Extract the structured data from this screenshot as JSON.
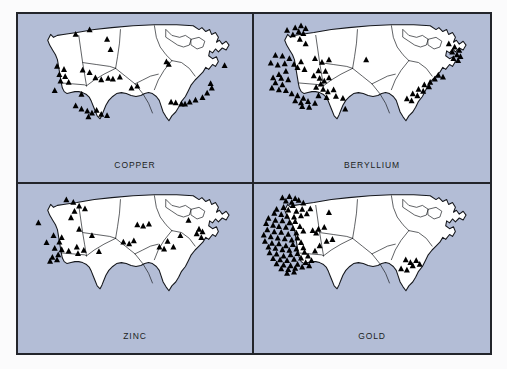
{
  "figure": {
    "background_color": "#fbfbfc",
    "panel_background_color": "#b3bdd6",
    "border_color": "#23252b",
    "land_fill_color": "#ffffff",
    "marker_color": "#000000",
    "marker_shape": "triangle",
    "map_subject": "contiguous-united-states",
    "layout": "2x2-grid"
  },
  "chart_data": {
    "type": "scatter",
    "subtitle": "",
    "xlabel": "",
    "ylabel": "",
    "grid": false,
    "legend_position": "none",
    "marker": "triangle",
    "panels": [
      {
        "id": "copper",
        "label": "COPPER",
        "position": "top-left",
        "marker_count": 42,
        "points": [
          [
            24.5,
            14.0
          ],
          [
            30.5,
            10.5
          ],
          [
            38.0,
            18.0
          ],
          [
            39.5,
            26.0
          ],
          [
            16.5,
            39.0
          ],
          [
            19.5,
            41.5
          ],
          [
            17.5,
            45.5
          ],
          [
            20.0,
            47.0
          ],
          [
            18.0,
            50.5
          ],
          [
            21.5,
            51.5
          ],
          [
            27.5,
            42.0
          ],
          [
            30.5,
            44.0
          ],
          [
            33.0,
            48.0
          ],
          [
            35.5,
            49.5
          ],
          [
            38.5,
            48.5
          ],
          [
            40.5,
            49.0
          ],
          [
            43.5,
            47.5
          ],
          [
            15.5,
            58.0
          ],
          [
            27.0,
            61.0
          ],
          [
            24.5,
            70.0
          ],
          [
            27.0,
            72.5
          ],
          [
            29.5,
            74.0
          ],
          [
            31.5,
            75.5
          ],
          [
            33.5,
            73.5
          ],
          [
            35.5,
            76.5
          ],
          [
            38.0,
            77.5
          ],
          [
            30.0,
            78.5
          ],
          [
            48.5,
            56.0
          ],
          [
            51.0,
            54.5
          ],
          [
            63.5,
            35.5
          ],
          [
            64.5,
            37.5
          ],
          [
            88.5,
            38.5
          ],
          [
            82.5,
            52.5
          ],
          [
            83.0,
            56.0
          ],
          [
            81.0,
            60.0
          ],
          [
            79.0,
            63.5
          ],
          [
            76.0,
            65.5
          ],
          [
            73.5,
            67.0
          ],
          [
            71.5,
            68.5
          ],
          [
            70.0,
            68.5
          ],
          [
            67.5,
            67.5
          ],
          [
            65.5,
            67.0
          ]
        ]
      },
      {
        "id": "beryllium",
        "label": "BERYLLIUM",
        "position": "top-right",
        "marker_count": 78,
        "points": [
          [
            13.5,
            11.0
          ],
          [
            17.0,
            9.0
          ],
          [
            19.5,
            7.5
          ],
          [
            21.5,
            9.5
          ],
          [
            18.5,
            12.0
          ],
          [
            20.5,
            13.5
          ],
          [
            16.0,
            14.5
          ],
          [
            19.0,
            18.0
          ],
          [
            21.5,
            21.5
          ],
          [
            8.5,
            30.5
          ],
          [
            11.5,
            31.0
          ],
          [
            14.5,
            33.0
          ],
          [
            6.5,
            36.5
          ],
          [
            9.5,
            38.0
          ],
          [
            12.5,
            37.0
          ],
          [
            16.5,
            37.5
          ],
          [
            19.5,
            35.5
          ],
          [
            18.0,
            40.0
          ],
          [
            21.0,
            41.5
          ],
          [
            13.0,
            43.0
          ],
          [
            10.0,
            45.5
          ],
          [
            7.5,
            48.0
          ],
          [
            11.0,
            48.5
          ],
          [
            14.0,
            49.5
          ],
          [
            8.5,
            52.0
          ],
          [
            11.5,
            53.5
          ],
          [
            7.0,
            56.0
          ],
          [
            10.0,
            57.5
          ],
          [
            13.0,
            58.0
          ],
          [
            15.5,
            60.5
          ],
          [
            18.0,
            62.0
          ],
          [
            20.5,
            64.0
          ],
          [
            17.0,
            66.0
          ],
          [
            19.5,
            67.5
          ],
          [
            22.5,
            66.5
          ],
          [
            25.5,
            68.0
          ],
          [
            20.0,
            70.5
          ],
          [
            23.0,
            71.0
          ],
          [
            25.5,
            33.0
          ],
          [
            28.5,
            36.0
          ],
          [
            31.5,
            34.0
          ],
          [
            27.0,
            42.5
          ],
          [
            30.0,
            43.0
          ],
          [
            25.0,
            46.5
          ],
          [
            27.5,
            48.5
          ],
          [
            29.5,
            50.5
          ],
          [
            31.5,
            48.0
          ],
          [
            28.0,
            53.0
          ],
          [
            26.0,
            55.5
          ],
          [
            29.0,
            57.0
          ],
          [
            31.0,
            59.0
          ],
          [
            33.5,
            57.5
          ],
          [
            27.0,
            62.0
          ],
          [
            30.5,
            63.5
          ],
          [
            34.5,
            62.5
          ],
          [
            37.5,
            64.0
          ],
          [
            38.5,
            72.5
          ],
          [
            47.5,
            34.0
          ],
          [
            83.0,
            21.5
          ],
          [
            85.5,
            24.0
          ],
          [
            87.5,
            26.5
          ],
          [
            84.5,
            28.0
          ],
          [
            86.5,
            30.0
          ],
          [
            88.0,
            31.5
          ],
          [
            85.0,
            33.0
          ],
          [
            87.0,
            34.5
          ],
          [
            78.5,
            46.0
          ],
          [
            80.5,
            47.5
          ],
          [
            77.0,
            49.0
          ],
          [
            75.0,
            51.5
          ],
          [
            72.5,
            53.5
          ],
          [
            74.5,
            55.0
          ],
          [
            70.0,
            57.0
          ],
          [
            72.0,
            58.5
          ],
          [
            67.5,
            60.5
          ],
          [
            69.5,
            62.0
          ],
          [
            65.0,
            64.5
          ],
          [
            67.0,
            66.0
          ]
        ]
      },
      {
        "id": "zinc",
        "label": "ZINC",
        "position": "bottom-left",
        "marker_count": 40,
        "points": [
          [
            20.5,
            10.5
          ],
          [
            23.5,
            12.5
          ],
          [
            26.0,
            15.5
          ],
          [
            28.5,
            17.5
          ],
          [
            24.0,
            19.5
          ],
          [
            22.5,
            24.5
          ],
          [
            8.5,
            28.5
          ],
          [
            26.0,
            33.5
          ],
          [
            15.0,
            38.5
          ],
          [
            18.5,
            40.0
          ],
          [
            12.0,
            44.0
          ],
          [
            17.5,
            43.5
          ],
          [
            15.5,
            48.5
          ],
          [
            18.5,
            49.5
          ],
          [
            21.5,
            50.5
          ],
          [
            17.0,
            53.5
          ],
          [
            14.5,
            55.5
          ],
          [
            16.5,
            57.5
          ],
          [
            13.5,
            58.5
          ],
          [
            25.0,
            47.5
          ],
          [
            28.0,
            50.0
          ],
          [
            25.5,
            52.5
          ],
          [
            31.5,
            38.5
          ],
          [
            34.5,
            51.0
          ],
          [
            45.0,
            43.5
          ],
          [
            47.5,
            45.0
          ],
          [
            49.5,
            42.5
          ],
          [
            51.0,
            30.0
          ],
          [
            53.5,
            31.0
          ],
          [
            56.0,
            29.5
          ],
          [
            64.0,
            43.0
          ],
          [
            66.5,
            47.5
          ],
          [
            62.5,
            49.0
          ],
          [
            60.5,
            47.5
          ],
          [
            69.5,
            38.5
          ],
          [
            73.0,
            26.5
          ],
          [
            77.5,
            33.5
          ],
          [
            79.0,
            35.5
          ],
          [
            76.5,
            37.0
          ],
          [
            78.5,
            40.0
          ]
        ]
      },
      {
        "id": "gold",
        "label": "GOLD",
        "position": "bottom-right",
        "marker_count": 96,
        "points": [
          [
            11.5,
            9.0
          ],
          [
            14.5,
            8.0
          ],
          [
            17.0,
            9.5
          ],
          [
            13.0,
            11.5
          ],
          [
            15.5,
            12.5
          ],
          [
            18.5,
            11.0
          ],
          [
            20.5,
            13.0
          ],
          [
            16.0,
            15.0
          ],
          [
            12.0,
            16.5
          ],
          [
            9.0,
            18.0
          ],
          [
            14.0,
            18.5
          ],
          [
            17.5,
            19.5
          ],
          [
            20.0,
            18.0
          ],
          [
            8.0,
            21.0
          ],
          [
            11.0,
            22.0
          ],
          [
            13.5,
            23.5
          ],
          [
            16.5,
            24.0
          ],
          [
            19.5,
            23.0
          ],
          [
            22.0,
            21.5
          ],
          [
            5.5,
            25.0
          ],
          [
            8.5,
            26.5
          ],
          [
            11.5,
            27.0
          ],
          [
            14.5,
            28.5
          ],
          [
            17.0,
            27.5
          ],
          [
            4.5,
            29.0
          ],
          [
            7.5,
            30.5
          ],
          [
            10.0,
            31.5
          ],
          [
            13.0,
            32.0
          ],
          [
            16.0,
            33.0
          ],
          [
            19.0,
            31.5
          ],
          [
            5.0,
            34.0
          ],
          [
            8.0,
            35.5
          ],
          [
            11.0,
            36.0
          ],
          [
            14.0,
            37.5
          ],
          [
            17.5,
            36.5
          ],
          [
            20.5,
            35.0
          ],
          [
            3.5,
            38.0
          ],
          [
            6.5,
            39.5
          ],
          [
            9.5,
            40.5
          ],
          [
            12.5,
            41.0
          ],
          [
            15.5,
            42.0
          ],
          [
            18.0,
            40.5
          ],
          [
            4.0,
            43.0
          ],
          [
            7.0,
            44.5
          ],
          [
            10.0,
            45.0
          ],
          [
            13.0,
            46.5
          ],
          [
            16.0,
            45.5
          ],
          [
            19.5,
            44.0
          ],
          [
            5.5,
            47.5
          ],
          [
            8.5,
            48.5
          ],
          [
            11.5,
            49.5
          ],
          [
            14.5,
            50.0
          ],
          [
            17.5,
            49.0
          ],
          [
            20.5,
            48.0
          ],
          [
            6.0,
            52.0
          ],
          [
            9.0,
            53.0
          ],
          [
            12.0,
            54.5
          ],
          [
            15.0,
            53.5
          ],
          [
            18.0,
            52.5
          ],
          [
            21.0,
            51.5
          ],
          [
            7.5,
            56.5
          ],
          [
            10.5,
            57.5
          ],
          [
            13.5,
            58.0
          ],
          [
            16.5,
            57.0
          ],
          [
            19.5,
            56.0
          ],
          [
            22.5,
            54.5
          ],
          [
            9.0,
            60.5
          ],
          [
            12.0,
            61.5
          ],
          [
            15.0,
            62.0
          ],
          [
            18.0,
            61.0
          ],
          [
            21.5,
            59.5
          ],
          [
            24.0,
            58.0
          ],
          [
            11.0,
            64.5
          ],
          [
            14.0,
            65.0
          ],
          [
            17.0,
            64.0
          ],
          [
            20.0,
            63.0
          ],
          [
            23.0,
            62.0
          ],
          [
            13.5,
            68.0
          ],
          [
            16.5,
            67.0
          ],
          [
            25.5,
            50.5
          ],
          [
            27.5,
            46.5
          ],
          [
            24.5,
            34.5
          ],
          [
            27.0,
            33.5
          ],
          [
            29.5,
            32.0
          ],
          [
            26.0,
            36.5
          ],
          [
            31.5,
            20.5
          ],
          [
            23.5,
            17.5
          ],
          [
            30.5,
            43.0
          ],
          [
            33.0,
            41.5
          ],
          [
            64.5,
            57.5
          ],
          [
            66.5,
            59.5
          ],
          [
            69.0,
            58.0
          ],
          [
            67.5,
            62.0
          ],
          [
            62.5,
            64.5
          ],
          [
            65.0,
            65.5
          ],
          [
            70.5,
            61.0
          ]
        ]
      }
    ]
  }
}
